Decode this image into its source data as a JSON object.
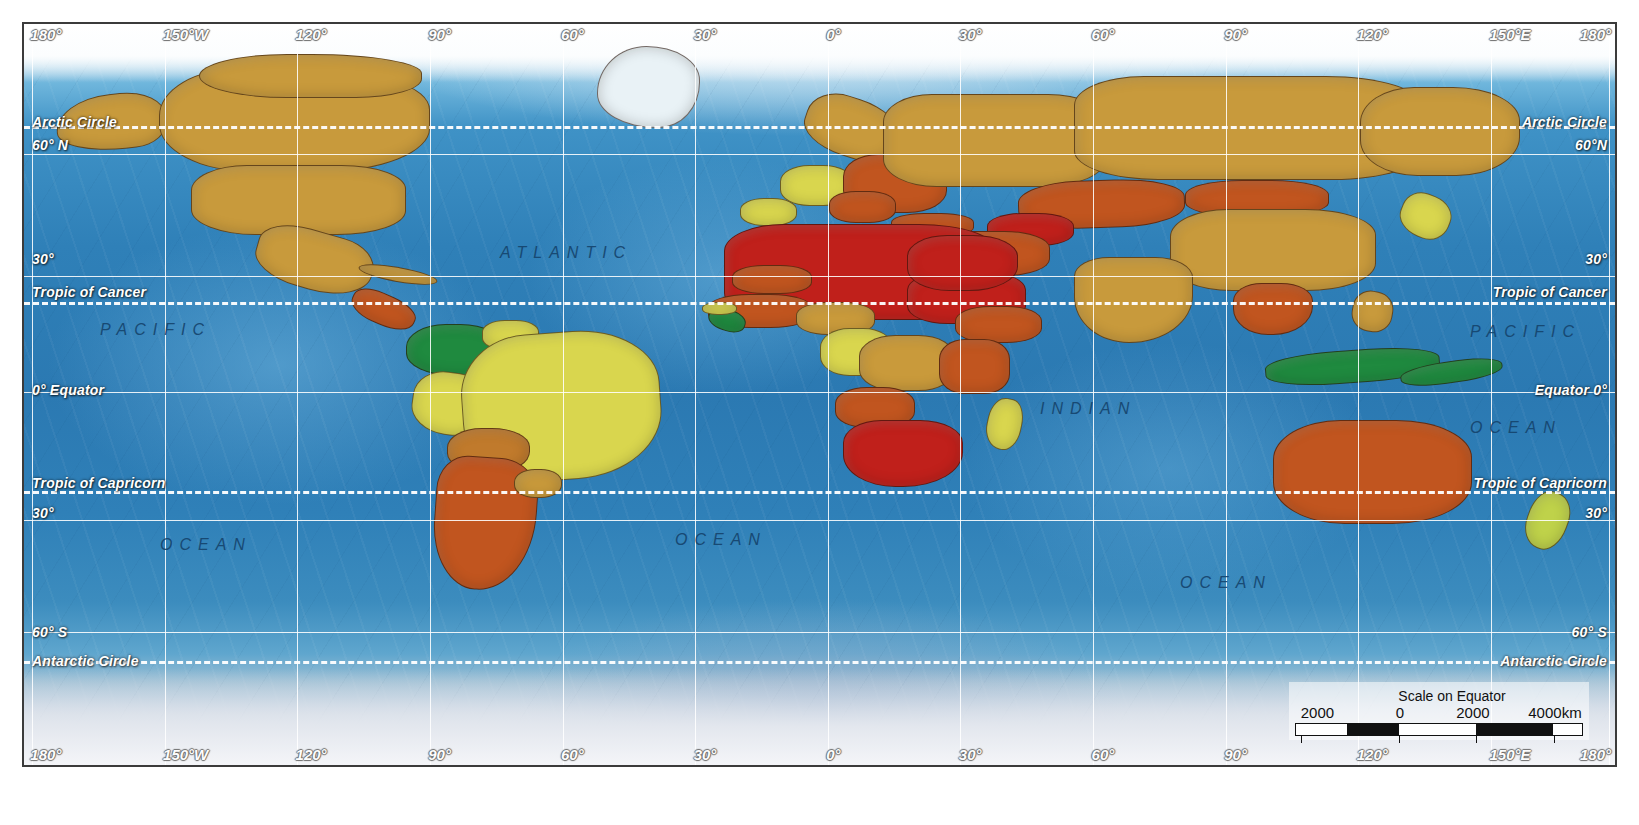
{
  "map": {
    "title": "World political map with shaded relief",
    "projection_note": "Scale on Equator",
    "graticule": {
      "longitude_top": [
        {
          "label": "180°",
          "x_pct": 0.4
        },
        {
          "label": "150°W",
          "x_pct": 8.74
        },
        {
          "label": "120°",
          "x_pct": 17.07
        },
        {
          "label": "90°",
          "x_pct": 25.41
        },
        {
          "label": "60°",
          "x_pct": 33.75
        },
        {
          "label": "30°",
          "x_pct": 42.09
        },
        {
          "label": "0°",
          "x_pct": 50.42
        },
        {
          "label": "30°",
          "x_pct": 58.76
        },
        {
          "label": "60°",
          "x_pct": 67.1
        },
        {
          "label": "90°",
          "x_pct": 75.44
        },
        {
          "label": "120°",
          "x_pct": 83.77
        },
        {
          "label": "150°E",
          "x_pct": 92.11
        },
        {
          "label": "180°",
          "x_pct": 99.0
        }
      ],
      "longitude_bottom": [
        {
          "label": "180°",
          "x_pct": 0.4
        },
        {
          "label": "150°W",
          "x_pct": 8.74
        },
        {
          "label": "120°",
          "x_pct": 17.07
        },
        {
          "label": "90°",
          "x_pct": 25.41
        },
        {
          "label": "60°",
          "x_pct": 33.75
        },
        {
          "label": "30°",
          "x_pct": 42.09
        },
        {
          "label": "0°",
          "x_pct": 50.42
        },
        {
          "label": "30°",
          "x_pct": 58.76
        },
        {
          "label": "60°",
          "x_pct": 67.1
        },
        {
          "label": "90°",
          "x_pct": 75.44
        },
        {
          "label": "120°",
          "x_pct": 83.77
        },
        {
          "label": "150°E",
          "x_pct": 92.11
        },
        {
          "label": "180°",
          "x_pct": 99.0
        }
      ],
      "meridian_x_pct": [
        0.5,
        8.84,
        17.17,
        25.51,
        33.85,
        42.19,
        50.52,
        58.86,
        67.2,
        75.54,
        83.87,
        92.21,
        99.6
      ],
      "parallel_solid_y_pct": [
        17.5,
        34.0,
        49.6,
        67.0,
        82.0
      ],
      "parallel_dashed_y_pct": [
        13.8,
        37.5,
        63.0,
        86.0
      ]
    },
    "latitude_labels_left": [
      {
        "label": "Arctic Circle",
        "y_px": 112
      },
      {
        "label": "60° N",
        "y_px": 135
      },
      {
        "label": "30°",
        "y_px": 249
      },
      {
        "label": "Tropic of Cancer",
        "y_px": 282
      },
      {
        "label": "0° Equator",
        "y_px": 380
      },
      {
        "label": "Tropic of Capricorn",
        "y_px": 473
      },
      {
        "label": "30°",
        "y_px": 503
      },
      {
        "label": "60° S",
        "y_px": 622
      },
      {
        "label": "Antarctic Circle",
        "y_px": 651
      }
    ],
    "latitude_labels_right": [
      {
        "label": "Arctic Circle",
        "y_px": 112
      },
      {
        "label": "60°N",
        "y_px": 135
      },
      {
        "label": "30°",
        "y_px": 249
      },
      {
        "label": "Tropic of Cancer",
        "y_px": 282
      },
      {
        "label": "Equator 0°",
        "y_px": 380
      },
      {
        "label": "Tropic of Capricorn",
        "y_px": 473
      },
      {
        "label": "30°",
        "y_px": 503
      },
      {
        "label": "60° S",
        "y_px": 622
      },
      {
        "label": "Antarctic Circle",
        "y_px": 651
      }
    ],
    "ocean_labels": [
      {
        "text": "ATLANTIC",
        "x_px": 500,
        "y_px": 248
      },
      {
        "text": "PACIFIC",
        "x_px": 100,
        "y_px": 325
      },
      {
        "text": "OCEAN",
        "x_px": 160,
        "y_px": 540
      },
      {
        "text": "OCEAN",
        "x_px": 675,
        "y_px": 535
      },
      {
        "text": "INDIAN",
        "x_px": 1040,
        "y_px": 404
      },
      {
        "text": "OCEAN",
        "x_px": 1180,
        "y_px": 578
      },
      {
        "text": "PACIFIC",
        "x_px": 1470,
        "y_px": 327
      },
      {
        "text": "OCEAN",
        "x_px": 1470,
        "y_px": 423
      }
    ]
  },
  "scalebar": {
    "title": "Scale on Equator",
    "labels": [
      {
        "text": "2000",
        "x_pct": 2
      },
      {
        "text": "0",
        "x_pct": 35
      },
      {
        "text": "2000",
        "x_pct": 56
      },
      {
        "text": "4000km",
        "x_pct": 81
      }
    ],
    "segments": [
      {
        "fill": "#ffffff",
        "w_pct": 18
      },
      {
        "fill": "#111111",
        "w_pct": 18
      },
      {
        "fill": "#ffffff",
        "w_pct": 27
      },
      {
        "fill": "#111111",
        "w_pct": 27
      },
      {
        "fill": "#ffffff",
        "w_pct": 10
      }
    ],
    "tick_x_pct": [
      2,
      36,
      63,
      90
    ]
  },
  "legend_colors": {
    "very_high": "#c0201b",
    "high": "#c1551f",
    "medium_high": "#c07a2c",
    "medium": "#c99a3b",
    "low": "#d9d64e",
    "very_low": "#1f8a3f",
    "ocean": "#2f80b8",
    "graticule": "#ffffff"
  },
  "regions": [
    {
      "name": "alaska",
      "color": "#c89a3c",
      "x": 2.0,
      "y": 9.5,
      "w": 7.0,
      "h": 7.5,
      "radius": "50% 40% 30% 60%/60% 50% 45% 40%",
      "rot": -6
    },
    {
      "name": "canada",
      "color": "#c89a3c",
      "x": 8.5,
      "y": 6.0,
      "w": 17.0,
      "h": 14.0,
      "radius": "30% 44% 40% 34%/46% 40% 42% 46%",
      "rot": 0
    },
    {
      "name": "canada-arctic",
      "color": "#c89a3c",
      "x": 11.0,
      "y": 4.0,
      "w": 14.0,
      "h": 6.0,
      "radius": "40% 50% 30% 40%/50% 44% 44% 50%",
      "rot": 0
    },
    {
      "name": "usa",
      "color": "#c89a3c",
      "x": 10.5,
      "y": 19.0,
      "w": 13.5,
      "h": 9.5,
      "radius": "26% 30% 32% 30%/36% 34% 34% 36%",
      "rot": 0
    },
    {
      "name": "mexico",
      "color": "#c89a3c",
      "x": 14.5,
      "y": 28.0,
      "w": 7.5,
      "h": 8.0,
      "radius": "40% 30% 48% 40%/40% 42% 50% 40%",
      "rot": 16
    },
    {
      "name": "central-america",
      "color": "#c1551f",
      "x": 20.5,
      "y": 36.5,
      "w": 4.2,
      "h": 4.2,
      "radius": "40% 44% 48% 40%/44% 40% 48% 44%",
      "rot": 24
    },
    {
      "name": "cuba-caribbean",
      "color": "#c99a3b",
      "x": 21.0,
      "y": 32.8,
      "w": 5.0,
      "h": 2.0,
      "radius": "50%",
      "rot": 10
    },
    {
      "name": "greenland-land",
      "color": "#e9f2f6",
      "x": 36.0,
      "y": 3.0,
      "w": 6.5,
      "h": 11.0,
      "radius": "48% 52% 40% 58%/58% 42% 56% 42%",
      "rot": 0
    },
    {
      "name": "colombia-venezuela",
      "color": "#1f8a3f",
      "x": 24.0,
      "y": 40.5,
      "w": 6.2,
      "h": 7.0,
      "radius": "40% 44% 40% 48%/44% 44% 44% 44%",
      "rot": 0
    },
    {
      "name": "guyanas",
      "color": "#d9d64e",
      "x": 28.8,
      "y": 40.0,
      "w": 3.6,
      "h": 4.0,
      "radius": "40%",
      "rot": 0
    },
    {
      "name": "peru-ecuador",
      "color": "#d9d64e",
      "x": 24.4,
      "y": 47.0,
      "w": 4.6,
      "h": 8.5,
      "radius": "44% 40% 42% 50%/42% 48% 44% 42%",
      "rot": 8
    },
    {
      "name": "brazil",
      "color": "#d9d64e",
      "x": 27.5,
      "y": 41.5,
      "w": 12.5,
      "h": 20.0,
      "radius": "34% 42% 44% 38%/40% 38% 44% 42%",
      "rot": -4
    },
    {
      "name": "bolivia",
      "color": "#c07a2c",
      "x": 26.6,
      "y": 54.5,
      "w": 5.2,
      "h": 6.0,
      "radius": "42% 46% 40% 44%/44% 42% 46% 42%",
      "rot": 0
    },
    {
      "name": "argentina-chile",
      "color": "#c1551f",
      "x": 25.8,
      "y": 58.5,
      "w": 6.4,
      "h": 18.0,
      "radius": "30% 38% 54% 44%/26% 28% 60% 50%",
      "rot": 4
    },
    {
      "name": "uruguay-para",
      "color": "#c99a3b",
      "x": 30.8,
      "y": 60.0,
      "w": 3.0,
      "h": 4.0,
      "radius": "44%",
      "rot": 0
    },
    {
      "name": "iberia",
      "color": "#d9d64e",
      "x": 45.0,
      "y": 23.5,
      "w": 3.6,
      "h": 3.8,
      "radius": "42%",
      "rot": 0
    },
    {
      "name": "western-europe",
      "color": "#d9d64e",
      "x": 47.5,
      "y": 19.0,
      "w": 4.6,
      "h": 5.5,
      "radius": "40%",
      "rot": 0
    },
    {
      "name": "scandinavia",
      "color": "#c89a3c",
      "x": 49.0,
      "y": 10.0,
      "w": 6.0,
      "h": 8.0,
      "radius": "38% 50% 36% 48%/46% 40% 48% 40%",
      "rot": 18
    },
    {
      "name": "eastern-europe",
      "color": "#c1551f",
      "x": 51.5,
      "y": 17.5,
      "w": 6.5,
      "h": 8.0,
      "radius": "34% 38% 38% 34%/38% 36% 38% 38%",
      "rot": 0
    },
    {
      "name": "balkans",
      "color": "#c1551f",
      "x": 50.6,
      "y": 22.5,
      "w": 4.2,
      "h": 4.4,
      "radius": "40%",
      "rot": 0
    },
    {
      "name": "turkey",
      "color": "#c1551f",
      "x": 54.5,
      "y": 25.5,
      "w": 5.2,
      "h": 3.2,
      "radius": "40%",
      "rot": 0
    },
    {
      "name": "russia-west",
      "color": "#c89a3c",
      "x": 54.0,
      "y": 9.5,
      "w": 14.0,
      "h": 12.5,
      "radius": "22% 26% 28% 24%/30% 28% 30% 30%",
      "rot": 0
    },
    {
      "name": "russia-east",
      "color": "#c89a3c",
      "x": 66.0,
      "y": 7.0,
      "w": 22.0,
      "h": 14.0,
      "radius": "20% 28% 26% 24%/28% 30% 28% 28%",
      "rot": 0
    },
    {
      "name": "russia-far-east",
      "color": "#c89a3c",
      "x": 84.0,
      "y": 8.5,
      "w": 10.0,
      "h": 12.0,
      "radius": "34% 42% 40% 36%/40% 38% 44% 40%",
      "rot": 0
    },
    {
      "name": "kazakhstan",
      "color": "#c1551f",
      "x": 62.5,
      "y": 21.0,
      "w": 10.5,
      "h": 6.5,
      "radius": "36% 42% 38% 40%/42% 40% 42% 40%",
      "rot": -2
    },
    {
      "name": "central-asia",
      "color": "#c0201b",
      "x": 60.5,
      "y": 25.5,
      "w": 5.5,
      "h": 4.5,
      "radius": "40%",
      "rot": 0
    },
    {
      "name": "mongolia",
      "color": "#c1551f",
      "x": 73.0,
      "y": 21.0,
      "w": 9.0,
      "h": 5.0,
      "radius": "40%",
      "rot": 0
    },
    {
      "name": "china",
      "color": "#c89a3c",
      "x": 72.0,
      "y": 25.0,
      "w": 13.0,
      "h": 11.0,
      "radius": "28% 34% 34% 30%/34% 32% 34% 34%",
      "rot": 0
    },
    {
      "name": "iran-afghan",
      "color": "#c1551f",
      "x": 57.0,
      "y": 28.0,
      "w": 7.5,
      "h": 6.0,
      "radius": "38%",
      "rot": 0
    },
    {
      "name": "india",
      "color": "#c89a3c",
      "x": 66.0,
      "y": 31.5,
      "w": 7.5,
      "h": 11.5,
      "radius": "32% 34% 58% 50%/24% 26% 60% 58%",
      "rot": 0
    },
    {
      "name": "sea-indochina",
      "color": "#c1551f",
      "x": 76.0,
      "y": 35.0,
      "w": 5.0,
      "h": 7.0,
      "radius": "36% 40% 50% 44%/34% 34% 56% 50%",
      "rot": 0
    },
    {
      "name": "indonesia",
      "color": "#1f8a3f",
      "x": 78.0,
      "y": 44.0,
      "w": 11.0,
      "h": 4.5,
      "radius": "40%",
      "rot": -4
    },
    {
      "name": "japan",
      "color": "#d9d64e",
      "x": 86.5,
      "y": 23.0,
      "w": 3.2,
      "h": 6.0,
      "radius": "40% 46% 40% 50%/44% 42% 46% 42%",
      "rot": 22
    },
    {
      "name": "philippines",
      "color": "#c89a3c",
      "x": 83.5,
      "y": 36.0,
      "w": 2.6,
      "h": 5.5,
      "radius": "44%",
      "rot": 10
    },
    {
      "name": "north-africa",
      "color": "#c0201b",
      "x": 44.0,
      "y": 27.0,
      "w": 17.0,
      "h": 13.0,
      "radius": "22% 28% 26% 24%/28% 26% 28% 28%",
      "rot": 0
    },
    {
      "name": "sahel-mali",
      "color": "#c1551f",
      "x": 44.5,
      "y": 32.5,
      "w": 5.0,
      "h": 4.0,
      "radius": "40%",
      "rot": 0
    },
    {
      "name": "west-africa-coast",
      "color": "#c1551f",
      "x": 43.0,
      "y": 36.5,
      "w": 6.5,
      "h": 4.5,
      "radius": "40%",
      "rot": 0
    },
    {
      "name": "liberia-sierra",
      "color": "#1f8a3f",
      "x": 43.0,
      "y": 38.5,
      "w": 2.4,
      "h": 3.0,
      "radius": "44%",
      "rot": 18
    },
    {
      "name": "guinea",
      "color": "#d9d64e",
      "x": 42.6,
      "y": 37.5,
      "w": 2.2,
      "h": 1.8,
      "radius": "44%",
      "rot": 0
    },
    {
      "name": "nigeria-cameroon",
      "color": "#c99a3b",
      "x": 48.5,
      "y": 37.5,
      "w": 5.0,
      "h": 4.5,
      "radius": "40%",
      "rot": 0
    },
    {
      "name": "gabon-congo",
      "color": "#d9d64e",
      "x": 50.0,
      "y": 41.0,
      "w": 4.6,
      "h": 6.5,
      "radius": "40%",
      "rot": 0
    },
    {
      "name": "drc",
      "color": "#c99a3b",
      "x": 52.5,
      "y": 42.0,
      "w": 6.0,
      "h": 7.5,
      "radius": "38%",
      "rot": 0
    },
    {
      "name": "sudan-ethiopia",
      "color": "#c0201b",
      "x": 55.5,
      "y": 33.5,
      "w": 7.5,
      "h": 7.0,
      "radius": "34%",
      "rot": 0
    },
    {
      "name": "ethiopia",
      "color": "#c1551f",
      "x": 58.5,
      "y": 38.0,
      "w": 5.5,
      "h": 5.0,
      "radius": "40%",
      "rot": 0
    },
    {
      "name": "east-africa",
      "color": "#c1551f",
      "x": 57.5,
      "y": 42.5,
      "w": 4.5,
      "h": 7.5,
      "radius": "36%",
      "rot": 0
    },
    {
      "name": "angola",
      "color": "#c1551f",
      "x": 51.0,
      "y": 49.0,
      "w": 5.0,
      "h": 5.5,
      "radius": "40%",
      "rot": 0
    },
    {
      "name": "southern-africa",
      "color": "#c0201b",
      "x": 51.5,
      "y": 53.5,
      "w": 7.5,
      "h": 9.0,
      "radius": "32% 36% 50% 44%/34% 34% 52% 48%",
      "rot": 0
    },
    {
      "name": "madagascar",
      "color": "#d9d64e",
      "x": 60.5,
      "y": 50.5,
      "w": 2.2,
      "h": 7.0,
      "radius": "44% 40% 44% 50%/44% 46% 44% 44%",
      "rot": 12
    },
    {
      "name": "saudi-arabia",
      "color": "#c0201b",
      "x": 55.5,
      "y": 28.5,
      "w": 7.0,
      "h": 7.5,
      "radius": "36% 40% 44% 38%/38% 38% 44% 40%",
      "rot": 0
    },
    {
      "name": "australia",
      "color": "#c1551f",
      "x": 78.5,
      "y": 53.5,
      "w": 12.5,
      "h": 14.0,
      "radius": "34% 38% 40% 36%/38% 36% 40% 40%",
      "rot": 0
    },
    {
      "name": "new-guinea",
      "color": "#1f8a3f",
      "x": 86.5,
      "y": 45.5,
      "w": 6.5,
      "h": 3.0,
      "radius": "44%",
      "rot": -8
    },
    {
      "name": "new-zealand",
      "color": "#bfd24a",
      "x": 94.5,
      "y": 63.0,
      "w": 2.6,
      "h": 8.0,
      "radius": "42% 46% 44% 48%/46% 42% 48% 44%",
      "rot": 20
    }
  ]
}
